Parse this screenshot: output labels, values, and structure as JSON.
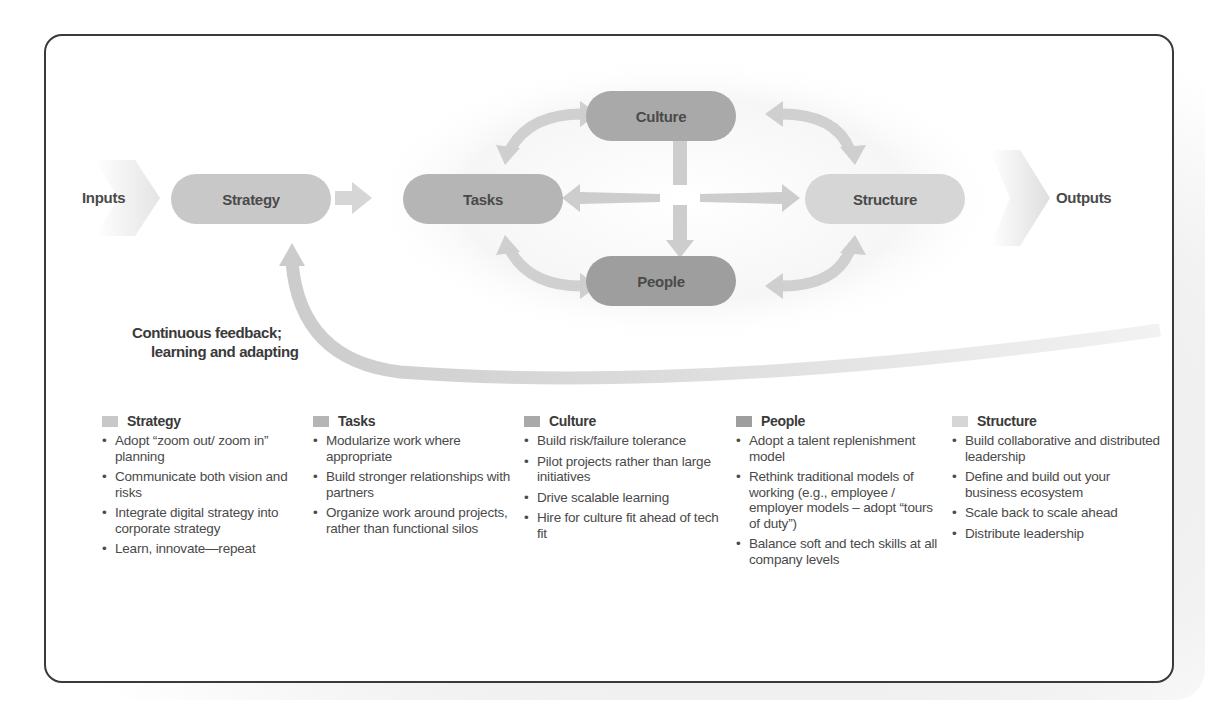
{
  "diagram": {
    "input_label": "Inputs",
    "output_label": "Outputs",
    "nodes": {
      "strategy": "Strategy",
      "tasks": "Tasks",
      "culture": "Culture",
      "people": "People",
      "structure": "Structure"
    },
    "feedback_label_line1": "Continuous feedback;",
    "feedback_label_line2": "learning and adapting",
    "colors": {
      "strategy": "#c8c8c8",
      "tasks": "#b5b5b5",
      "culture": "#a9a9a9",
      "people": "#9e9e9e",
      "structure": "#d6d6d6",
      "arrow": "#cfcfcf",
      "border": "#3a3a3a"
    }
  },
  "columns": [
    {
      "title": "Strategy",
      "swatch": "#c8c8c8",
      "items": [
        "Adopt  “zoom out/ zoom in” planning",
        "Communicate both vision and risks",
        "Integrate digital strategy into corporate strategy",
        "Learn, innovate—repeat"
      ]
    },
    {
      "title": "Tasks",
      "swatch": "#b5b5b5",
      "items": [
        "Modularize work where appropriate",
        "Build stronger relationships with partners",
        "Organize work around projects, rather than functional silos"
      ]
    },
    {
      "title": "Culture",
      "swatch": "#a9a9a9",
      "items": [
        "Build risk/failure tolerance",
        "Pilot projects rather than large initiatives",
        "Drive scalable learning",
        "Hire for culture fit ahead of tech fit"
      ]
    },
    {
      "title": "People",
      "swatch": "#9e9e9e",
      "items": [
        "Adopt a talent replenishment model",
        "Rethink traditional models of working (e.g., employee / employer models – adopt “tours of duty”)",
        "Balance soft and tech skills at all company levels"
      ]
    },
    {
      "title": "Structure",
      "swatch": "#d6d6d6",
      "items": [
        "Build collaborative and distributed leadership",
        "Define and build out your business ecosystem",
        "Scale back to scale ahead",
        "Distribute leadership"
      ]
    }
  ]
}
